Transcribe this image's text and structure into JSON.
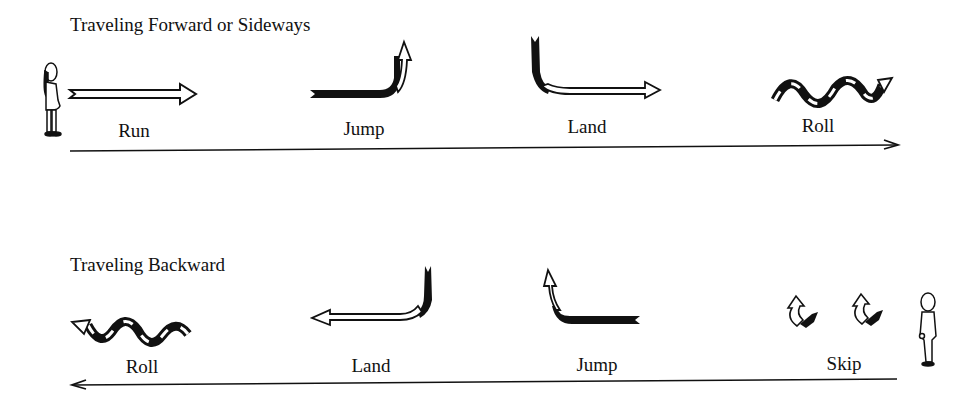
{
  "diagram": {
    "sections": [
      {
        "heading": "Traveling Forward or Sideways",
        "direction": "forward",
        "movements": [
          {
            "label": "Run",
            "icon": "straight-arrow-right"
          },
          {
            "label": "Jump",
            "icon": "jump-arrow-up-right"
          },
          {
            "label": "Land",
            "icon": "land-arrow-down-right"
          },
          {
            "label": "Roll",
            "icon": "roll-wave-arrow-right"
          }
        ]
      },
      {
        "heading": "Traveling Backward",
        "direction": "backward",
        "movements": [
          {
            "label": "Roll",
            "icon": "roll-wave-arrow-left"
          },
          {
            "label": "Land",
            "icon": "land-arrow-down-left"
          },
          {
            "label": "Jump",
            "icon": "jump-arrow-up-left"
          },
          {
            "label": "Skip",
            "icon": "skip-arrows"
          }
        ]
      }
    ],
    "colors": {
      "ink": "#111111",
      "background": "#ffffff"
    }
  }
}
